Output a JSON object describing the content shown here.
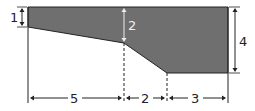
{
  "diagram": {
    "colors": {
      "fill": "#6f6f6f",
      "line": "#222222",
      "background": "#ffffff",
      "inner_label": "#e8e8e8"
    },
    "dimensions": {
      "left_depth": "1",
      "middle_depth": "2",
      "right_depth": "4",
      "width_first": "5",
      "width_second": "2",
      "width_third": "3"
    }
  }
}
